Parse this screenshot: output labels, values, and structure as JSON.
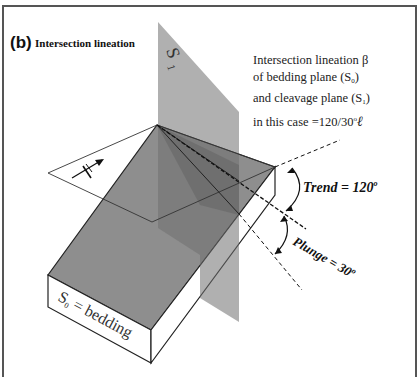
{
  "figure": {
    "panel_label": "(b)",
    "panel_title": "Intersection lineation"
  },
  "description": {
    "line1": "Intersection lineation β",
    "line2_prefix": "of bedding plane (S",
    "line2_sub": "0",
    "line2_suffix": ")",
    "line3_prefix": "and cleavage plane (S",
    "line3_sub": "1",
    "line3_suffix": ")",
    "line4_prefix": "in this case =120/30",
    "line4_degree": "o",
    "line4_symbol": "ℓ"
  },
  "labels": {
    "s1_letter": "S",
    "s1_sub": "1",
    "bedding_letter": "S",
    "bedding_sub": "0",
    "bedding_text": " = bedding",
    "trend": "Trend = 120",
    "trend_degree": "o",
    "plunge": "Plunge = 30",
    "plunge_degree": "o",
    "north_symbol": "N"
  },
  "colors": {
    "plane_gray": "#8a8a8a",
    "block_top": "#8c8c8c",
    "block_side": "#ffffff",
    "line": "#222222",
    "frame": "#555555"
  }
}
